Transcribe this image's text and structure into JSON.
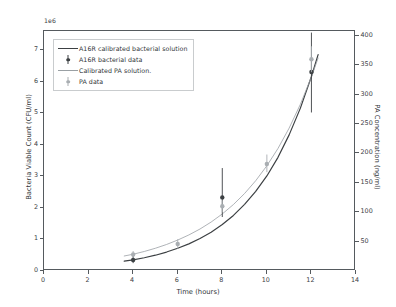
{
  "chart_data": {
    "type": "line",
    "title": "",
    "xlabel": "Time (hours)",
    "ylabel": "Bacteria Viable Count (CFU/ml)",
    "y2label": "PA Concentration (ng/ml)",
    "y_exponent_label": "1e6",
    "xlim": [
      0,
      14
    ],
    "ylim": [
      0,
      7.6
    ],
    "y2lim": [
      0,
      408
    ],
    "grid": false,
    "legend_position": "upper left",
    "xticks": [
      0,
      2,
      4,
      6,
      8,
      10,
      12,
      14
    ],
    "xtick_labels": [
      "0",
      "2",
      "4",
      "6",
      "8",
      "10",
      "12",
      "14"
    ],
    "yticks": [
      0,
      1,
      2,
      3,
      4,
      5,
      6,
      7
    ],
    "ytick_labels": [
      "0",
      "1",
      "2",
      "3",
      "4",
      "5",
      "6",
      "7"
    ],
    "y2ticks": [
      50,
      100,
      150,
      200,
      250,
      300,
      350,
      400
    ],
    "y2tick_labels": [
      "50",
      "100",
      "150",
      "200",
      "250",
      "300",
      "350",
      "400"
    ],
    "series": [
      {
        "name": "A16R calibrated bacterial solution",
        "kind": "line",
        "axis": "left",
        "color": "#3c4043",
        "linewidth": 1.2,
        "x": [
          3.6,
          4.0,
          4.5,
          5.0,
          5.5,
          6.0,
          6.5,
          7.0,
          7.5,
          8.0,
          8.5,
          9.0,
          9.5,
          10.0,
          10.5,
          11.0,
          11.5,
          12.0,
          12.3
        ],
        "values": [
          0.31,
          0.35,
          0.42,
          0.5,
          0.6,
          0.72,
          0.86,
          1.03,
          1.23,
          1.47,
          1.76,
          2.11,
          2.52,
          3.01,
          3.6,
          4.31,
          5.15,
          6.16,
          6.85
        ]
      },
      {
        "name": "Calibrated PA solution.",
        "kind": "line",
        "axis": "right",
        "color": "#9aa0a4",
        "linewidth": 0.8,
        "x": [
          3.6,
          4.0,
          4.5,
          5.0,
          5.5,
          6.0,
          6.5,
          7.0,
          7.5,
          8.0,
          8.5,
          9.0,
          9.5,
          10.0,
          10.5,
          11.0,
          11.5,
          12.0,
          12.3
        ],
        "values": [
          25.5,
          28.5,
          33.2,
          38.7,
          45.1,
          52.6,
          61.3,
          71.4,
          83.2,
          97.0,
          113.0,
          131.7,
          153.5,
          178.9,
          208.4,
          242.9,
          283.1,
          329.9,
          362.0
        ]
      },
      {
        "name": "A16R bacterial data",
        "kind": "errorbar-points",
        "axis": "left",
        "color": "#3c4043",
        "x": [
          4,
          8,
          12
        ],
        "values": [
          0.35,
          2.33,
          6.3
        ],
        "yerr_low": [
          0.1,
          0.62,
          1.28
        ],
        "yerr_high": [
          0.14,
          0.93,
          1.25
        ]
      },
      {
        "name": "PA data",
        "kind": "errorbar-points",
        "axis": "right",
        "color": "#a9aeb2",
        "x": [
          4,
          6,
          8,
          10,
          12
        ],
        "values": [
          28.0,
          46.0,
          110.0,
          182.0,
          360.0
        ],
        "yerr_low": [
          5.0,
          8.0,
          10.0,
          14.0,
          22.0
        ],
        "yerr_high": [
          6.0,
          8.0,
          10.0,
          16.0,
          22.0
        ]
      }
    ],
    "legend_entries": [
      {
        "label": "A16R calibrated bacterial solution",
        "key": "line",
        "tone": "dark"
      },
      {
        "label": "A16R bacterial data",
        "key": "marker",
        "tone": "dark"
      },
      {
        "label": "Calibrated PA solution.",
        "key": "line",
        "tone": "light"
      },
      {
        "label": "PA data",
        "key": "marker",
        "tone": "light"
      }
    ]
  }
}
